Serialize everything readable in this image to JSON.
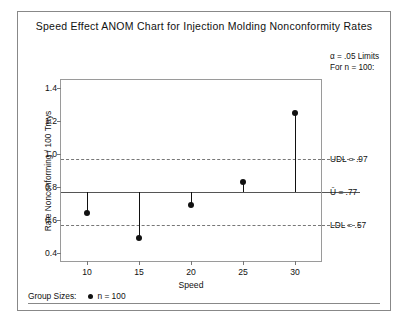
{
  "chart_data": {
    "type": "scatter",
    "title": "Speed Effect ANOM Chart for Injection Molding Nonconformity Rates",
    "xlabel": "Speed",
    "ylabel": "Rate Nonconforming / 100 Trays",
    "categories": [
      "10",
      "15",
      "20",
      "25",
      "30"
    ],
    "x": [
      10,
      15,
      20,
      25,
      30
    ],
    "values": [
      0.64,
      0.49,
      0.69,
      0.83,
      1.25
    ],
    "xlim": [
      7.5,
      32.5
    ],
    "ylim": [
      0.35,
      1.45
    ],
    "yticks": [
      "1.4",
      "1.2",
      "1.0",
      "0.8",
      "0.6",
      "0.4"
    ],
    "ytick_values": [
      1.4,
      1.2,
      1.0,
      0.8,
      0.6,
      0.4
    ],
    "xticks": [
      "10",
      "15",
      "20",
      "25",
      "30"
    ],
    "grid": false,
    "legend_position": "bottom-left",
    "reference_lines": [
      {
        "name": "UDL",
        "label": "UDL = .97",
        "value": 0.97,
        "style": "dashed"
      },
      {
        "name": "center",
        "label": "Ū = .77",
        "value": 0.77,
        "style": "solid"
      },
      {
        "name": "LDL",
        "label": "LDL = .57",
        "value": 0.57,
        "style": "dashed"
      }
    ],
    "annotations": {
      "alpha_line1": "α = .05 Limits",
      "alpha_line2": "For n = 100:"
    },
    "series": [
      {
        "name": "Rate Nonconforming / 100 Trays",
        "values": [
          0.64,
          0.49,
          0.69,
          0.83,
          1.25
        ]
      }
    ]
  },
  "legend": {
    "group_sizes_label": "Group Sizes:",
    "group_size_value": "n = 100"
  },
  "colors": {
    "ink": "#111111",
    "frame": "#888888",
    "reference": "#555555",
    "dashed": "#777777",
    "background": "#ffffff"
  }
}
